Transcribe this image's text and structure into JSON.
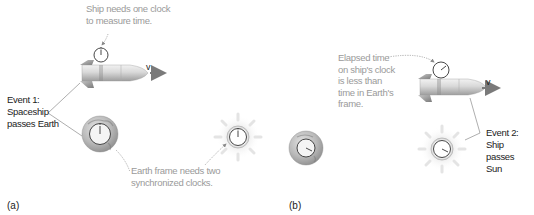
{
  "panel_a": {
    "label": "(a)",
    "ship_note": [
      "Ship needs one clock",
      "to measure time."
    ],
    "event1": [
      "Event 1:",
      "Spaceship",
      "passes Earth"
    ],
    "earth_note": [
      "Earth frame needs two",
      "synchronized clocks."
    ],
    "velocity_label": "v"
  },
  "panel_b": {
    "label": "(b)",
    "elapsed_note": [
      "Elapsed time",
      "on ship's clock",
      "is less than",
      "time in Earth's",
      "frame."
    ],
    "event2": [
      "Event 2:",
      "Ship passes",
      "Sun"
    ],
    "velocity_label": "v"
  },
  "colors": {
    "annotation_text": "#9a9a9a",
    "event_text": "#222222",
    "rocket_body": "#d8d8d8",
    "rocket_fins": "#8c8c8c",
    "earth": "#b5b5b5",
    "sun_glow": "#e6e6e6",
    "arrow": "#7a7a7a"
  },
  "icons": {
    "rocket": "rocket-icon",
    "clock": "clock-icon",
    "earth": "earth-icon",
    "sun": "sun-icon",
    "arrow": "velocity-arrow-icon"
  }
}
